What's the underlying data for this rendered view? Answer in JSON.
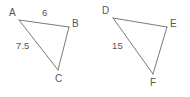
{
  "figure": {
    "background_color": "#ffffff",
    "stroke_color": "#7a7a7a",
    "text_color": "#565656",
    "shapes": [
      {
        "id": "triangle-abc",
        "name": "triangle-abc",
        "vertices": [
          {
            "id": "A",
            "label": "A",
            "x": 19,
            "y": 20,
            "label_x": 9,
            "label_y": 8
          },
          {
            "id": "B",
            "label": "B",
            "x": 69,
            "y": 27,
            "label_x": 72,
            "label_y": 19
          },
          {
            "id": "C",
            "label": "C",
            "x": 58,
            "y": 70,
            "label_x": 55,
            "label_y": 74
          }
        ],
        "edges": [
          {
            "id": "AB",
            "from": "A",
            "to": "B",
            "label": "6",
            "label_x": 42,
            "label_y": 8
          },
          {
            "id": "AC",
            "from": "A",
            "to": "C",
            "label": "7.5",
            "label_x": 16,
            "label_y": 41
          },
          {
            "id": "BC",
            "from": "B",
            "to": "C",
            "label": "",
            "label_x": 0,
            "label_y": 0
          }
        ]
      },
      {
        "id": "triangle-def",
        "name": "triangle-def",
        "vertices": [
          {
            "id": "D",
            "label": "D",
            "x": 113,
            "y": 18,
            "label_x": 102,
            "label_y": 6
          },
          {
            "id": "E",
            "label": "E",
            "x": 167,
            "y": 27,
            "label_x": 170,
            "label_y": 19
          },
          {
            "id": "F",
            "label": "F",
            "x": 153,
            "y": 74,
            "label_x": 150,
            "label_y": 78
          }
        ],
        "edges": [
          {
            "id": "DE",
            "from": "D",
            "to": "E",
            "label": "",
            "label_x": 0,
            "label_y": 0
          },
          {
            "id": "DF",
            "from": "D",
            "to": "F",
            "label": "15",
            "label_x": 112,
            "label_y": 41
          },
          {
            "id": "EF",
            "from": "E",
            "to": "F",
            "label": "",
            "label_x": 0,
            "label_y": 0
          }
        ]
      }
    ]
  }
}
